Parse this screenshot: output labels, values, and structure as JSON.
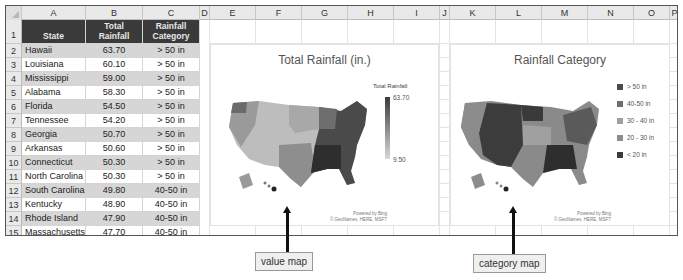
{
  "columns": [
    "A",
    "B",
    "C",
    "D",
    "E",
    "F",
    "G",
    "H",
    "I",
    "J",
    "K",
    "L",
    "M",
    "N",
    "O",
    "P"
  ],
  "table": {
    "headers": {
      "state": "State",
      "total": "Total Rainfall",
      "category": "Rainfall Category"
    },
    "rows": [
      {
        "n": "2",
        "state": "Hawaii",
        "total": "63.70",
        "category": "> 50 in"
      },
      {
        "n": "3",
        "state": "Louisiana",
        "total": "60.10",
        "category": "> 50 in"
      },
      {
        "n": "4",
        "state": "Mississippi",
        "total": "59.00",
        "category": "> 50 in"
      },
      {
        "n": "5",
        "state": "Alabama",
        "total": "58.30",
        "category": "> 50 in"
      },
      {
        "n": "6",
        "state": "Florida",
        "total": "54.50",
        "category": "> 50 in"
      },
      {
        "n": "7",
        "state": "Tennessee",
        "total": "54.20",
        "category": "> 50 in"
      },
      {
        "n": "8",
        "state": "Georgia",
        "total": "50.70",
        "category": "> 50 in"
      },
      {
        "n": "9",
        "state": "Arkansas",
        "total": "50.60",
        "category": "> 50 in"
      },
      {
        "n": "10",
        "state": "Connecticut",
        "total": "50.30",
        "category": "> 50 in"
      },
      {
        "n": "11",
        "state": "North Carolina",
        "total": "50.30",
        "category": "> 50 in"
      },
      {
        "n": "12",
        "state": "South Carolina",
        "total": "49.80",
        "category": "40-50 in"
      },
      {
        "n": "13",
        "state": "Kentucky",
        "total": "48.90",
        "category": "40-50 in"
      },
      {
        "n": "14",
        "state": "Rhode Island",
        "total": "47.90",
        "category": "40-50 in"
      },
      {
        "n": "15",
        "state": "Massachusetts",
        "total": "47.70",
        "category": "40-50 in"
      }
    ]
  },
  "value_map": {
    "title": "Total Rainfall (in.)",
    "legend_title": "Total Rainfall",
    "legend_max": "63.70",
    "legend_min": "9.50",
    "credit_1": "Powered by Bing",
    "credit_2": "© GeoNames, HERE, MSFT"
  },
  "category_map": {
    "title": "Rainfall Category",
    "legend": [
      {
        "label": "> 50 in",
        "color": "#4a4a4a"
      },
      {
        "label": "40-50 in",
        "color": "#6e6e6e"
      },
      {
        "label": "30 - 40 in",
        "color": "#a0a0a0"
      },
      {
        "label": "20 - 30 in",
        "color": "#8c8c8c"
      },
      {
        "label": "< 20 in",
        "color": "#3a3a3a"
      }
    ],
    "credit_1": "Powered by Bing",
    "credit_2": "© GeoNames, HERE, MSFT"
  },
  "callouts": {
    "value": "value map",
    "category": "category map"
  }
}
